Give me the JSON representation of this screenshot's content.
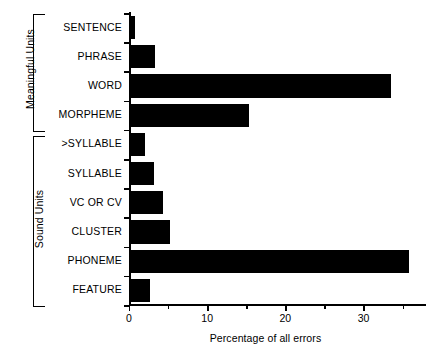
{
  "chart_data": {
    "type": "bar",
    "orientation": "horizontal",
    "title": "",
    "xlabel": "Percentage of all errors",
    "ylabel": "",
    "xlim": [
      0,
      38
    ],
    "grid": false,
    "legend": null,
    "categories": [
      "SENTENCE",
      "PHRASE",
      "WORD",
      "MORPHEME",
      ">SYLLABLE",
      "SYLLABLE",
      "VC OR CV",
      "CLUSTER",
      "PHONEME",
      "FEATURE"
    ],
    "values": [
      0.8,
      3.3,
      33.5,
      15.3,
      2.0,
      3.2,
      4.3,
      5.2,
      35.8,
      2.7
    ],
    "bar_color": "#000000",
    "xticks": [
      0,
      10,
      20,
      30
    ],
    "xtick_labels": [
      "0",
      "10",
      "20",
      "30"
    ],
    "xticks_minor": [
      5,
      15,
      25,
      35
    ],
    "groups": [
      {
        "label": "Meaningful Units",
        "categories": [
          "SENTENCE",
          "PHRASE",
          "WORD",
          "MORPHEME"
        ]
      },
      {
        "label": "Sound Units",
        "categories": [
          ">SYLLABLE",
          "SYLLABLE",
          "VC OR CV",
          "CLUSTER",
          "PHONEME",
          "FEATURE"
        ]
      }
    ]
  },
  "axis": {
    "x_title": "Percentage of all errors"
  },
  "groups": {
    "meaningful": "Meaningful Units",
    "sound": "Sound Units"
  }
}
